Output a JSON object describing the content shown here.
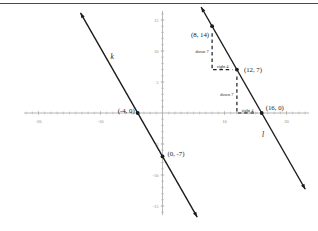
{
  "figure": {
    "kind": "coordinate-plane-graph",
    "top_rule": true
  },
  "colors": {
    "line": "#1c1c1c",
    "axis": "#9a9a9a",
    "tick": "#a8a8a8",
    "tick_label": "#8a8a8a",
    "text": "#1c1c1c",
    "rule": "#4a4a4a",
    "background": "#ffffff"
  },
  "chart_data": {
    "type": "line",
    "title": "",
    "xlabel": "",
    "ylabel": "",
    "grid": false,
    "xlim": [
      -22,
      23
    ],
    "ylim": [
      -16,
      16
    ],
    "x_ticks_labeled": [
      {
        "v": -20,
        "label": "-20"
      },
      {
        "v": -10,
        "label": "-10"
      },
      {
        "v": 10,
        "label": "10"
      },
      {
        "v": 20,
        "label": "20"
      }
    ],
    "y_ticks_labeled": [
      {
        "v": 15,
        "label": "15"
      },
      {
        "v": 10,
        "label": "10"
      },
      {
        "v": 5,
        "label": "5"
      },
      {
        "v": -5,
        "label": "-5"
      },
      {
        "v": -10,
        "label": "-10"
      },
      {
        "v": -15,
        "label": "-15"
      }
    ],
    "minor_tick_step": 1,
    "lines": [
      {
        "name": "k",
        "label": "k",
        "slope": -1.75,
        "anchor": {
          "x": -4,
          "y": 0
        },
        "y_extent": [
          16.15,
          -16.8
        ],
        "label_pos": {
          "x": -8.1,
          "y": 8.7
        },
        "points": [
          {
            "x": -4,
            "y": 0,
            "label": "(-4, 0)",
            "label_anchor": "end",
            "label_dx": -3,
            "label_dy": 0
          },
          {
            "x": 0,
            "y": -7,
            "label": "(0, -7)",
            "label_anchor": "start",
            "label_dx": 5,
            "label_dy": 0
          }
        ]
      },
      {
        "name": "l",
        "label": "l",
        "slope": -1.75,
        "anchor": {
          "x": 16,
          "y": 0
        },
        "y_extent": [
          17.1,
          -12.3
        ],
        "label_pos": {
          "x": 16.2,
          "y": -3.9
        },
        "points": [
          {
            "x": 8,
            "y": 14,
            "label": "(8, 14)",
            "label_anchor": "end",
            "label_dx": -3,
            "label_dy": 11
          },
          {
            "x": 12,
            "y": 7,
            "label": "(12, 7)",
            "label_anchor": "start",
            "label_dx": 7,
            "label_dy": 2
          },
          {
            "x": 16,
            "y": 0,
            "label": "(16, 0)",
            "label_anchor": "start",
            "label_dx": 4,
            "label_dy": -3
          }
        ]
      }
    ],
    "annotations": [
      {
        "from": {
          "x": 8,
          "y": 14
        },
        "to": {
          "x": 8,
          "y": 7
        },
        "label": "down 7",
        "label_side": "left"
      },
      {
        "from": {
          "x": 8,
          "y": 7
        },
        "to": {
          "x": 12,
          "y": 7
        },
        "label": "right 4",
        "label_side": "above"
      },
      {
        "from": {
          "x": 12,
          "y": 7
        },
        "to": {
          "x": 12,
          "y": 0
        },
        "label": "down 7",
        "label_side": "left"
      },
      {
        "from": {
          "x": 12,
          "y": 0
        },
        "to": {
          "x": 16,
          "y": 0
        },
        "label": "right 4",
        "label_side": "above"
      }
    ]
  }
}
